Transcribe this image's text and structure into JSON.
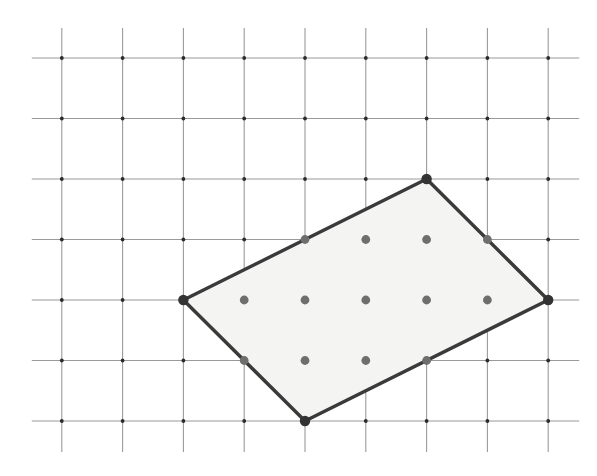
{
  "figure": {
    "canvas": {
      "width": 597,
      "height": 476,
      "background": "#ffffff"
    }
  },
  "grid": {
    "origin_x": 61.8,
    "origin_y": 58.0,
    "spacing_x": 60.8,
    "spacing_y": 60.5,
    "columns": 9,
    "rows": 7,
    "line_color": "#9a9a9a",
    "line_width": 1.1,
    "overhang_start": 30,
    "overhang_end": 31,
    "node_dot_color": "#2b2b2b",
    "node_dot_radius": 1.9
  },
  "polygon": {
    "name": "rotated-rectangle",
    "vertices_grid": [
      {
        "col": 2,
        "row": 4,
        "label": "left-vertex"
      },
      {
        "col": 6,
        "row": 2,
        "label": "top-vertex"
      },
      {
        "col": 8,
        "row": 4,
        "label": "right-vertex"
      },
      {
        "col": 4,
        "row": 6,
        "label": "bottom-vertex"
      }
    ],
    "fill_color": "#f4f4f2",
    "stroke_color": "#3a3a3a",
    "stroke_width": 3.4
  },
  "lattice_markers": {
    "color": "#6e6e6e",
    "radius": 4.4,
    "vertex_color": "#333333",
    "vertex_radius": 5.2,
    "interior_points_grid": [
      {
        "col": 4,
        "row": 3
      },
      {
        "col": 5,
        "row": 3
      },
      {
        "col": 6,
        "row": 3
      },
      {
        "col": 7,
        "row": 3
      },
      {
        "col": 3,
        "row": 4
      },
      {
        "col": 4,
        "row": 4
      },
      {
        "col": 5,
        "row": 4
      },
      {
        "col": 6,
        "row": 4
      },
      {
        "col": 7,
        "row": 4
      },
      {
        "col": 3,
        "row": 5
      },
      {
        "col": 4,
        "row": 5
      },
      {
        "col": 5,
        "row": 5
      },
      {
        "col": 6,
        "row": 5
      }
    ],
    "counts": {
      "boundary_marked": 8,
      "interior_marked": 9,
      "total_marked": 17
    }
  },
  "chart_data": {
    "type": "scatter",
    "xlabel": "",
    "ylabel": "",
    "xlim": [
      0,
      8
    ],
    "ylim": [
      0,
      6
    ],
    "grid": true,
    "legend": "none",
    "series": [
      {
        "name": "rectangle-outline",
        "type": "polygon",
        "x": [
          2,
          6,
          8,
          4
        ],
        "y": [
          2,
          4,
          2,
          0
        ],
        "closed": true
      },
      {
        "name": "marked-lattice-points",
        "type": "scatter",
        "x": [
          2,
          4,
          5,
          6,
          7,
          6,
          3,
          4,
          5,
          6,
          7,
          8,
          3,
          4,
          5,
          6,
          4
        ],
        "y": [
          2,
          3,
          3,
          3,
          3,
          4,
          2,
          2,
          2,
          2,
          2,
          2,
          1,
          1,
          1,
          1,
          0
        ]
      }
    ],
    "annotations": []
  }
}
